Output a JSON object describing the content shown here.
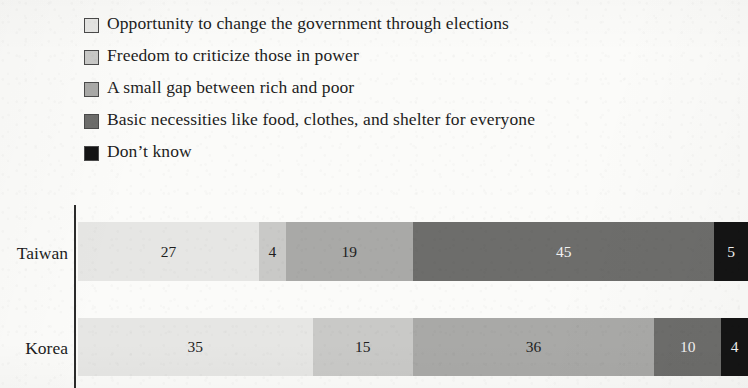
{
  "legend": {
    "items": [
      {
        "label": "Opportunity to change the government through elections",
        "color": "#e6e6e4",
        "swatch_name": "legend-swatch-opportunity"
      },
      {
        "label": "Freedom to criticize those in power",
        "color": "#c9c9c7",
        "swatch_name": "legend-swatch-freedom"
      },
      {
        "label": "A small gap between rich and poor",
        "color": "#a9a9a7",
        "swatch_name": "legend-swatch-small-gap"
      },
      {
        "label": "Basic necessities like food, clothes, and shelter for everyone",
        "color": "#6d6d6b",
        "swatch_name": "legend-swatch-basic-necessities"
      },
      {
        "label": "Don’t know",
        "color": "#141414",
        "swatch_name": "legend-swatch-dont-know"
      }
    ]
  },
  "chart_data": {
    "type": "bar",
    "orientation": "horizontal",
    "stacked": true,
    "normalized": true,
    "title": "",
    "subtitle": "",
    "xlabel": "",
    "ylabel": "",
    "xlim": [
      0,
      100
    ],
    "grid": false,
    "legend_position": "top-left",
    "categories": [
      "Taiwan",
      "Korea"
    ],
    "series": [
      {
        "name": "Opportunity to change the government through elections",
        "color": "#e6e6e4",
        "text_color": "dark",
        "values": [
          27,
          35
        ]
      },
      {
        "name": "Freedom to criticize those in power",
        "color": "#c9c9c7",
        "text_color": "dark",
        "values": [
          4,
          15
        ]
      },
      {
        "name": "A small gap between rich and poor",
        "color": "#a9a9a7",
        "text_color": "dark",
        "values": [
          19,
          36
        ]
      },
      {
        "name": "Basic necessities like food, clothes, and shelter for everyone",
        "color": "#6d6d6b",
        "text_color": "light",
        "values": [
          45,
          10
        ]
      },
      {
        "name": "Don’t know",
        "color": "#141414",
        "text_color": "light",
        "values": [
          5,
          4
        ]
      }
    ],
    "rows": [
      {
        "category": "Taiwan",
        "segments": [
          {
            "label": "27",
            "value": 27,
            "color": "#e6e6e4",
            "text_color": "dark"
          },
          {
            "label": "4",
            "value": 4,
            "color": "#c9c9c7",
            "text_color": "dark"
          },
          {
            "label": "19",
            "value": 19,
            "color": "#a9a9a7",
            "text_color": "dark"
          },
          {
            "label": "45",
            "value": 45,
            "color": "#6d6d6b",
            "text_color": "light"
          },
          {
            "label": "5",
            "value": 5,
            "color": "#141414",
            "text_color": "light"
          }
        ]
      },
      {
        "category": "Korea",
        "segments": [
          {
            "label": "35",
            "value": 35,
            "color": "#e6e6e4",
            "text_color": "dark"
          },
          {
            "label": "15",
            "value": 15,
            "color": "#c9c9c7",
            "text_color": "dark"
          },
          {
            "label": "36",
            "value": 36,
            "color": "#a9a9a7",
            "text_color": "dark"
          },
          {
            "label": "10",
            "value": 10,
            "color": "#6d6d6b",
            "text_color": "light"
          },
          {
            "label": "4",
            "value": 4,
            "color": "#141414",
            "text_color": "light"
          }
        ]
      }
    ]
  },
  "axis": {
    "line_color": "#2b2b2b"
  }
}
